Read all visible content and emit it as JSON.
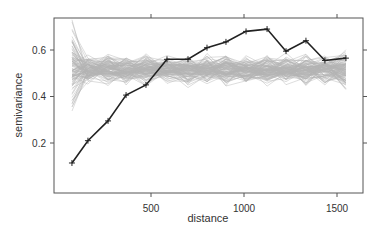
{
  "chart_data": {
    "type": "line",
    "title": "",
    "xlabel": "distance",
    "ylabel": "semivariance",
    "xlim": [
      0,
      1650
    ],
    "ylim": [
      0.05,
      0.74
    ],
    "x_ticks": [
      500,
      1000,
      1500
    ],
    "x_tick_labels": [
      "500",
      "1000",
      "1500"
    ],
    "y_ticks": [
      0.2,
      0.4,
      0.6
    ],
    "y_tick_labels": [
      "0.2",
      "0.4",
      "0.6"
    ],
    "grid": false,
    "legend": null,
    "series": [
      {
        "name": "empirical variogram",
        "color": "#222222",
        "marker": "+",
        "x": [
          75,
          161,
          269,
          366,
          473,
          586,
          699,
          801,
          903,
          1011,
          1124,
          1226,
          1333,
          1435,
          1548
        ],
        "values": [
          0.114,
          0.21,
          0.295,
          0.406,
          0.45,
          0.56,
          0.56,
          0.61,
          0.635,
          0.68,
          0.69,
          0.595,
          0.64,
          0.555,
          0.565
        ]
      },
      {
        "name": "permutation envelope (simulated variograms)",
        "color": "#b4b4b4",
        "count": 100,
        "center": 0.515,
        "spread_start": [
          0.34,
          0.72
        ],
        "spread_typical": [
          0.46,
          0.58
        ],
        "spread_end": [
          0.42,
          0.6
        ]
      }
    ]
  }
}
